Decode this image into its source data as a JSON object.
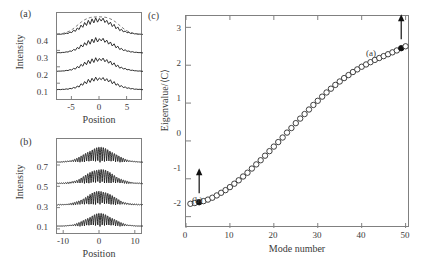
{
  "figure": {
    "panels": [
      {
        "id": "a",
        "label": "(a)",
        "xlabel": "Position",
        "ylabel": "Intensity",
        "xticks": [
          "-5",
          "0",
          "5"
        ],
        "yticks": [
          "0.1",
          "0.2",
          "0.3",
          "0.4"
        ]
      },
      {
        "id": "b",
        "label": "(b)",
        "xlabel": "Position",
        "ylabel": "Intensity",
        "xticks": [
          "-10",
          "0",
          "10"
        ],
        "yticks": [
          "0.1",
          "0.3",
          "0.5",
          "0.7"
        ]
      },
      {
        "id": "c",
        "label": "(c)",
        "xlabel": "Mode number",
        "ylabel": "Eigenvalue/⟨C⟩",
        "xticks": [
          "0",
          "10",
          "20",
          "30",
          "40",
          "50"
        ],
        "yticks": [
          "-2",
          "-1",
          "0",
          "1",
          "2",
          "3"
        ],
        "annotations": [
          {
            "text": "(a)",
            "mode": 49,
            "value": 2.45
          },
          {
            "text": "(b)",
            "mode": 3,
            "value": -1.62
          }
        ]
      }
    ]
  },
  "chart_data": [
    {
      "type": "line",
      "panel": "a",
      "title": "",
      "xlabel": "Position",
      "ylabel": "Intensity",
      "xlim": [
        -7,
        7
      ],
      "ylim": [
        0.04,
        0.52
      ],
      "xticks": [
        -5,
        0,
        5
      ],
      "yticks": [
        0.1,
        0.2,
        0.3,
        0.4
      ],
      "grid": false,
      "series": [
        {
          "name": "trace-0.1",
          "style": "solid",
          "offset": 0.1,
          "x": [
            -7,
            -6.7,
            -6.4,
            -6.1,
            -5.8,
            -5.5,
            -5.2,
            -4.9,
            -4.6,
            -4.3,
            -4,
            -3.7,
            -3.4,
            -3.1,
            -2.8,
            -2.5,
            -2.2,
            -1.9,
            -1.6,
            -1.3,
            -1,
            -0.7,
            -0.4,
            -0.1,
            0.2,
            0.5,
            0.8,
            1.1,
            1.4,
            1.7,
            2,
            2.3,
            2.6,
            2.9,
            3.2,
            3.5,
            3.8,
            4.1,
            4.4,
            4.7,
            5,
            5.3,
            5.6,
            5.9,
            6.2,
            6.5,
            6.8,
            7
          ],
          "y": [
            0.002,
            0.003,
            0.002,
            0.004,
            0.003,
            0.006,
            0.004,
            0.009,
            0.007,
            0.014,
            0.01,
            0.022,
            0.016,
            0.034,
            0.026,
            0.046,
            0.034,
            0.058,
            0.041,
            0.064,
            0.048,
            0.07,
            0.052,
            0.066,
            0.056,
            0.068,
            0.05,
            0.062,
            0.044,
            0.056,
            0.034,
            0.046,
            0.026,
            0.034,
            0.018,
            0.024,
            0.013,
            0.017,
            0.009,
            0.012,
            0.006,
            0.008,
            0.004,
            0.005,
            0.003,
            0.004,
            0.002,
            0.002
          ]
        },
        {
          "name": "trace-0.2",
          "style": "solid",
          "offset": 0.2,
          "x": [
            -7,
            -6.7,
            -6.4,
            -6.1,
            -5.8,
            -5.5,
            -5.2,
            -4.9,
            -4.6,
            -4.3,
            -4,
            -3.7,
            -3.4,
            -3.1,
            -2.8,
            -2.5,
            -2.2,
            -1.9,
            -1.6,
            -1.3,
            -1,
            -0.7,
            -0.4,
            -0.1,
            0.2,
            0.5,
            0.8,
            1.1,
            1.4,
            1.7,
            2,
            2.3,
            2.6,
            2.9,
            3.2,
            3.5,
            3.8,
            4.1,
            4.4,
            4.7,
            5,
            5.3,
            5.6,
            5.9,
            6.2,
            6.5,
            6.8,
            7
          ],
          "y": [
            0.002,
            0.003,
            0.003,
            0.004,
            0.004,
            0.007,
            0.006,
            0.011,
            0.009,
            0.018,
            0.014,
            0.028,
            0.021,
            0.04,
            0.03,
            0.052,
            0.038,
            0.062,
            0.044,
            0.07,
            0.05,
            0.076,
            0.056,
            0.072,
            0.06,
            0.074,
            0.054,
            0.066,
            0.046,
            0.058,
            0.036,
            0.048,
            0.027,
            0.036,
            0.019,
            0.025,
            0.014,
            0.018,
            0.01,
            0.012,
            0.007,
            0.008,
            0.005,
            0.005,
            0.003,
            0.004,
            0.002,
            0.002
          ]
        },
        {
          "name": "trace-0.3",
          "style": "solid",
          "offset": 0.3,
          "x": [
            -7,
            -6.7,
            -6.4,
            -6.1,
            -5.8,
            -5.5,
            -5.2,
            -4.9,
            -4.6,
            -4.3,
            -4,
            -3.7,
            -3.4,
            -3.1,
            -2.8,
            -2.5,
            -2.2,
            -1.9,
            -1.6,
            -1.3,
            -1,
            -0.7,
            -0.4,
            -0.1,
            0.2,
            0.5,
            0.8,
            1.1,
            1.4,
            1.7,
            2,
            2.3,
            2.6,
            2.9,
            3.2,
            3.5,
            3.8,
            4.1,
            4.4,
            4.7,
            5,
            5.3,
            5.6,
            5.9,
            6.2,
            6.5,
            6.8,
            7
          ],
          "y": [
            0.003,
            0.004,
            0.003,
            0.005,
            0.005,
            0.008,
            0.007,
            0.013,
            0.011,
            0.021,
            0.017,
            0.032,
            0.025,
            0.046,
            0.035,
            0.058,
            0.044,
            0.07,
            0.05,
            0.078,
            0.058,
            0.086,
            0.062,
            0.08,
            0.068,
            0.082,
            0.06,
            0.072,
            0.05,
            0.062,
            0.04,
            0.052,
            0.03,
            0.039,
            0.021,
            0.027,
            0.015,
            0.019,
            0.011,
            0.013,
            0.007,
            0.009,
            0.005,
            0.006,
            0.004,
            0.004,
            0.003,
            0.002
          ]
        },
        {
          "name": "trace-0.4",
          "style": "solid",
          "offset": 0.4,
          "x": [
            -7,
            -6.7,
            -6.4,
            -6.1,
            -5.8,
            -5.5,
            -5.2,
            -4.9,
            -4.6,
            -4.3,
            -4,
            -3.7,
            -3.4,
            -3.1,
            -2.8,
            -2.5,
            -2.2,
            -1.9,
            -1.6,
            -1.3,
            -1,
            -0.7,
            -0.4,
            -0.1,
            0.2,
            0.5,
            0.8,
            1.1,
            1.4,
            1.7,
            2,
            2.3,
            2.6,
            2.9,
            3.2,
            3.5,
            3.8,
            4.1,
            4.4,
            4.7,
            5,
            5.3,
            5.6,
            5.9,
            6.2,
            6.5,
            6.8,
            7
          ],
          "y": [
            0.003,
            0.004,
            0.004,
            0.006,
            0.006,
            0.01,
            0.008,
            0.016,
            0.013,
            0.026,
            0.02,
            0.038,
            0.03,
            0.054,
            0.042,
            0.068,
            0.052,
            0.08,
            0.058,
            0.088,
            0.066,
            0.094,
            0.07,
            0.09,
            0.076,
            0.092,
            0.068,
            0.08,
            0.058,
            0.07,
            0.046,
            0.058,
            0.034,
            0.044,
            0.024,
            0.031,
            0.017,
            0.022,
            0.012,
            0.015,
            0.008,
            0.01,
            0.006,
            0.007,
            0.004,
            0.005,
            0.003,
            0.003
          ]
        },
        {
          "name": "envelope-dashed",
          "style": "dashed",
          "offset": 0.4,
          "x": [
            -7,
            -6.5,
            -6,
            -5.5,
            -5,
            -4.5,
            -4,
            -3.5,
            -3,
            -2.5,
            -2,
            -1.5,
            -1,
            -0.5,
            0,
            0.5,
            1,
            1.5,
            2,
            2.5,
            3,
            3.5,
            4,
            4.5,
            5,
            5.5,
            6,
            6.5,
            7
          ],
          "y": [
            0.004,
            0.006,
            0.009,
            0.014,
            0.021,
            0.031,
            0.044,
            0.058,
            0.072,
            0.083,
            0.091,
            0.096,
            0.098,
            0.099,
            0.099,
            0.098,
            0.096,
            0.091,
            0.083,
            0.072,
            0.058,
            0.044,
            0.031,
            0.021,
            0.014,
            0.009,
            0.006,
            0.004,
            0.003
          ]
        }
      ]
    },
    {
      "type": "line",
      "panel": "b",
      "title": "",
      "xlabel": "Position",
      "ylabel": "Intensity",
      "xlim": [
        -12,
        12
      ],
      "ylim": [
        0.02,
        0.92
      ],
      "xticks": [
        -10,
        0,
        10
      ],
      "yticks": [
        0.1,
        0.3,
        0.5,
        0.7
      ],
      "grid": false,
      "series": [
        {
          "name": "trace-0.1",
          "style": "oscillatory",
          "offset": 0.1,
          "envelope_amplitude": 0.115,
          "envelope_width": 3.6,
          "carrier_period": 0.62,
          "baseline_ripple": 0.009
        },
        {
          "name": "trace-0.3",
          "style": "oscillatory",
          "offset": 0.3,
          "envelope_amplitude": 0.125,
          "envelope_width": 3.7,
          "carrier_period": 0.62,
          "baseline_ripple": 0.009
        },
        {
          "name": "trace-0.5",
          "style": "oscillatory",
          "offset": 0.5,
          "envelope_amplitude": 0.13,
          "envelope_width": 3.8,
          "carrier_period": 0.62,
          "baseline_ripple": 0.009
        },
        {
          "name": "trace-0.7",
          "style": "oscillatory",
          "offset": 0.7,
          "envelope_amplitude": 0.135,
          "envelope_width": 3.9,
          "carrier_period": 0.62,
          "baseline_ripple": 0.009
        }
      ]
    },
    {
      "type": "scatter",
      "panel": "c",
      "title": "",
      "xlabel": "Mode number",
      "ylabel": "Eigenvalue/⟨C⟩",
      "xlim": [
        0,
        51
      ],
      "ylim": [
        -2.3,
        3.3
      ],
      "xticks": [
        0,
        10,
        20,
        30,
        40,
        50
      ],
      "yticks": [
        -2,
        -1,
        0,
        1,
        2,
        3
      ],
      "grid": false,
      "marker": "open-circle",
      "x": [
        1,
        2,
        3,
        4,
        5,
        6,
        7,
        8,
        9,
        10,
        11,
        12,
        13,
        14,
        15,
        16,
        17,
        18,
        19,
        20,
        21,
        22,
        23,
        24,
        25,
        26,
        27,
        28,
        29,
        30,
        31,
        32,
        33,
        34,
        35,
        36,
        37,
        38,
        39,
        40,
        41,
        42,
        43,
        44,
        45,
        46,
        47,
        48,
        49,
        50
      ],
      "y": [
        -1.66,
        -1.64,
        -1.62,
        -1.59,
        -1.55,
        -1.5,
        -1.44,
        -1.37,
        -1.3,
        -1.22,
        -1.13,
        -1.04,
        -0.94,
        -0.84,
        -0.73,
        -0.62,
        -0.51,
        -0.39,
        -0.27,
        -0.15,
        -0.03,
        0.09,
        0.22,
        0.34,
        0.47,
        0.59,
        0.71,
        0.83,
        0.95,
        1.06,
        1.17,
        1.28,
        1.38,
        1.48,
        1.57,
        1.66,
        1.74,
        1.82,
        1.89,
        1.96,
        2.02,
        2.08,
        2.14,
        2.19,
        2.24,
        2.29,
        2.34,
        2.39,
        2.45,
        2.5
      ],
      "highlighted": [
        {
          "index": 49,
          "x": 49,
          "y": 2.45,
          "marker": "filled-circle",
          "label": "(a)"
        },
        {
          "index": 3,
          "x": 3,
          "y": -1.62,
          "marker": "filled-circle",
          "label": "(b)"
        }
      ]
    }
  ]
}
